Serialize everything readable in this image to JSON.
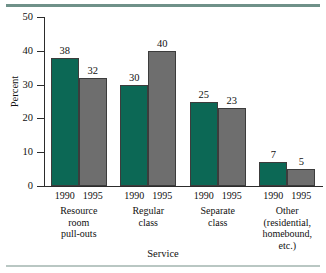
{
  "chart_data": {
    "type": "bar",
    "title": "",
    "subtitle": "",
    "xlabel": "Service",
    "ylabel": "Percent",
    "ylim": [
      0,
      50
    ],
    "yticks": [
      0,
      10,
      20,
      30,
      40,
      50
    ],
    "ytick_labels": [
      "0",
      "10",
      "20",
      "30",
      "40",
      "50"
    ],
    "grid": false,
    "legend": "none",
    "categories": [
      "Resource room pull-outs",
      "Regular class",
      "Separate class",
      "Other (residential, homebound, etc.)"
    ],
    "category_lines": [
      [
        "Resource",
        "room",
        "pull-outs"
      ],
      [
        "Regular",
        "class"
      ],
      [
        "Separate",
        "class"
      ],
      [
        "Other",
        "(residential,",
        "homebound,",
        "etc.)"
      ]
    ],
    "series": [
      {
        "name": "1990",
        "color": "#0c6855",
        "values": [
          38,
          30,
          25,
          7
        ]
      },
      {
        "name": "1995",
        "color": "#6e6e6e",
        "values": [
          32,
          40,
          23,
          5
        ]
      }
    ],
    "bars": [
      {
        "group": 0,
        "series": "1990",
        "value": 38,
        "label": "38",
        "year": "1990"
      },
      {
        "group": 0,
        "series": "1995",
        "value": 32,
        "label": "32",
        "year": "1995"
      },
      {
        "group": 1,
        "series": "1990",
        "value": 30,
        "label": "30",
        "year": "1990"
      },
      {
        "group": 1,
        "series": "1995",
        "value": 40,
        "label": "40",
        "year": "1995"
      },
      {
        "group": 2,
        "series": "1990",
        "value": 25,
        "label": "25",
        "year": "1990"
      },
      {
        "group": 2,
        "series": "1995",
        "value": 23,
        "label": "23",
        "year": "1995"
      },
      {
        "group": 3,
        "series": "1990",
        "value": 7,
        "label": "7",
        "year": "1990"
      },
      {
        "group": 3,
        "series": "1995",
        "value": 5,
        "label": "5",
        "year": "1995"
      }
    ]
  },
  "decor": {
    "top_rule_color": "#6f9189",
    "bottom_rule_color": "#b9c7c3"
  }
}
